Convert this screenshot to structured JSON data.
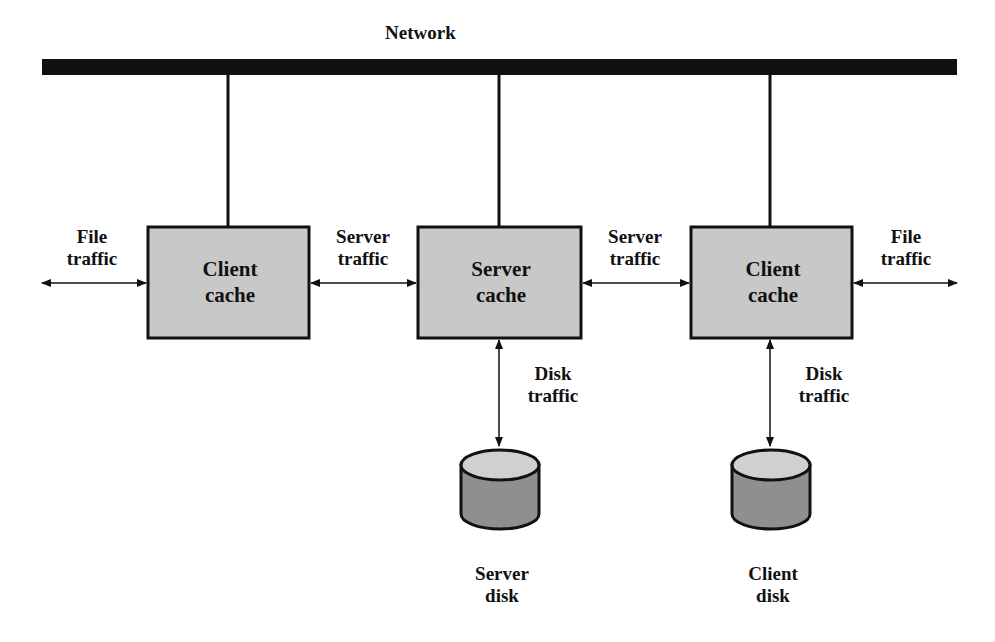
{
  "diagram": {
    "network": {
      "label": "Network"
    },
    "nodes": [
      {
        "id": "client_cache_left",
        "label_line1": "Client",
        "label_line2": "cache"
      },
      {
        "id": "server_cache",
        "label_line1": "Server",
        "label_line2": "cache"
      },
      {
        "id": "client_cache_right",
        "label_line1": "Client",
        "label_line2": "cache"
      }
    ],
    "disks": [
      {
        "id": "server_disk",
        "label_line1": "Server",
        "label_line2": "disk"
      },
      {
        "id": "client_disk",
        "label_line1": "Client",
        "label_line2": "disk"
      }
    ],
    "edges": [
      {
        "id": "file_traffic_left",
        "label_line1": "File",
        "label_line2": "traffic"
      },
      {
        "id": "server_traffic_left",
        "label_line1": "Server",
        "label_line2": "traffic"
      },
      {
        "id": "server_traffic_right",
        "label_line1": "Server",
        "label_line2": "traffic"
      },
      {
        "id": "file_traffic_right",
        "label_line1": "File",
        "label_line2": "traffic"
      },
      {
        "id": "disk_traffic_server",
        "label_line1": "Disk",
        "label_line2": "traffic"
      },
      {
        "id": "disk_traffic_client",
        "label_line1": "Disk",
        "label_line2": "traffic"
      }
    ],
    "colors": {
      "box_fill": "#c8c8c8",
      "disk_top": "#d0d0d0",
      "disk_body": "#8f8f8f",
      "line": "#111111"
    }
  }
}
